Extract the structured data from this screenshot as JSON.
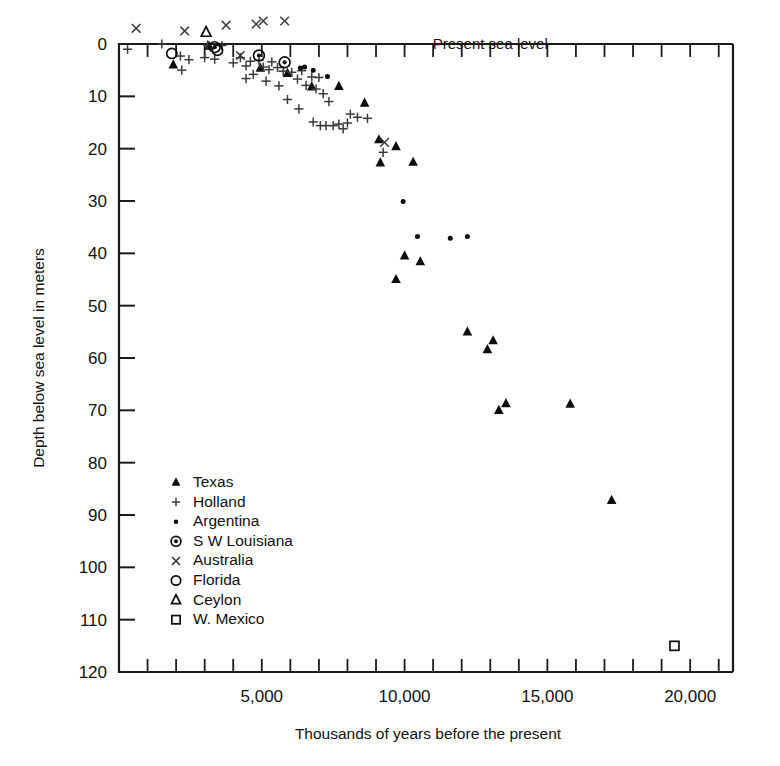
{
  "figure": {
    "background": "#ffffff",
    "ink": "#111111"
  },
  "axes": {
    "x_title": "Thousands of years before the present",
    "y_title": "Depth below sea level in meters",
    "x_tick_labels": [
      "5,000",
      "10,000",
      "15,000",
      "20,000"
    ],
    "x_tick_values": [
      5000,
      10000,
      15000,
      20000
    ],
    "y_tick_labels": [
      "0",
      "10",
      "20",
      "30",
      "40",
      "50",
      "60",
      "70",
      "80",
      "90",
      "100",
      "110",
      "120"
    ],
    "y_tick_values": [
      0,
      10,
      20,
      30,
      40,
      50,
      60,
      70,
      80,
      90,
      100,
      110,
      120
    ],
    "x_min": 0,
    "x_max": 21500,
    "y_min": 0,
    "y_max": 120,
    "x_minor_step": 1000,
    "y_major_step": 10
  },
  "annotations": [
    {
      "name": "present-sea-level",
      "text": "Present sea level",
      "x": 13000,
      "y": 0
    }
  ],
  "legend": {
    "entries": [
      {
        "label": "Texas",
        "marker": "filled-triangle"
      },
      {
        "label": "Holland",
        "marker": "plus"
      },
      {
        "label": "Argentina",
        "marker": "dot"
      },
      {
        "label": "S W Louisiana",
        "marker": "circled-dot"
      },
      {
        "label": "Australia",
        "marker": "cross"
      },
      {
        "label": "Florida",
        "marker": "open-circle"
      },
      {
        "label": "Ceylon",
        "marker": "open-triangle"
      },
      {
        "label": "W. Mexico",
        "marker": "open-square"
      }
    ]
  },
  "chart_data": {
    "type": "scatter",
    "title": "",
    "xlabel": "Thousands of years before the present",
    "ylabel": "Depth below sea level in meters",
    "xlim": [
      0,
      21500
    ],
    "ylim": [
      120,
      0
    ],
    "y_inverted": true,
    "grid": false,
    "legend_position": "inside-lower-left",
    "series": [
      {
        "name": "Texas",
        "marker": "filled-triangle",
        "points": [
          [
            1900,
            4.0
          ],
          [
            3150,
            0.4
          ],
          [
            4950,
            4.6
          ],
          [
            5900,
            5.6
          ],
          [
            6750,
            8.2
          ],
          [
            7700,
            8.1
          ],
          [
            8600,
            11.3
          ],
          [
            9100,
            18.3
          ],
          [
            9700,
            19.6
          ],
          [
            9150,
            22.7
          ],
          [
            10300,
            22.6
          ],
          [
            10000,
            40.5
          ],
          [
            9700,
            45.0
          ],
          [
            10550,
            41.6
          ],
          [
            12200,
            55.0
          ],
          [
            13100,
            56.7
          ],
          [
            12900,
            58.4
          ],
          [
            13300,
            70.0
          ],
          [
            13550,
            68.7
          ],
          [
            15800,
            68.8
          ],
          [
            17250,
            87.2
          ]
        ]
      },
      {
        "name": "Holland",
        "marker": "plus",
        "points": [
          [
            300,
            1.0
          ],
          [
            1500,
            0.0
          ],
          [
            2150,
            2.3
          ],
          [
            2450,
            3.0
          ],
          [
            2200,
            5.0
          ],
          [
            3000,
            2.6
          ],
          [
            3100,
            0.2
          ],
          [
            3350,
            2.9
          ],
          [
            3600,
            0.3
          ],
          [
            4000,
            3.6
          ],
          [
            4250,
            2.6
          ],
          [
            4450,
            4.2
          ],
          [
            4600,
            3.3
          ],
          [
            4700,
            5.8
          ],
          [
            4900,
            3.1
          ],
          [
            5050,
            4.4
          ],
          [
            5250,
            4.9
          ],
          [
            5350,
            3.4
          ],
          [
            5550,
            4.5
          ],
          [
            5750,
            5.2
          ],
          [
            5600,
            8.0
          ],
          [
            6050,
            5.4
          ],
          [
            6250,
            6.7
          ],
          [
            6400,
            5.1
          ],
          [
            6550,
            7.9
          ],
          [
            6750,
            6.3
          ],
          [
            6900,
            8.6
          ],
          [
            7000,
            6.4
          ],
          [
            6300,
            12.4
          ],
          [
            7150,
            9.5
          ],
          [
            7350,
            11.0
          ],
          [
            6800,
            14.9
          ],
          [
            7050,
            15.6
          ],
          [
            7250,
            15.6
          ],
          [
            7500,
            15.6
          ],
          [
            7700,
            15.3
          ],
          [
            7850,
            16.2
          ],
          [
            8000,
            15.1
          ],
          [
            8100,
            13.4
          ],
          [
            8350,
            14.0
          ],
          [
            8700,
            14.2
          ],
          [
            9250,
            20.7
          ],
          [
            5900,
            10.6
          ],
          [
            5150,
            7.1
          ],
          [
            4450,
            6.6
          ]
        ]
      },
      {
        "name": "Argentina",
        "marker": "dot",
        "points": [
          [
            6350,
            4.6
          ],
          [
            6500,
            4.4
          ],
          [
            6800,
            5.0
          ],
          [
            7300,
            6.2
          ],
          [
            9950,
            30.1
          ],
          [
            10450,
            36.8
          ],
          [
            11600,
            37.1
          ],
          [
            12200,
            36.8
          ]
        ]
      },
      {
        "name": "S W Louisiana",
        "marker": "circled-dot",
        "points": [
          [
            3350,
            0.6
          ],
          [
            4900,
            2.2
          ],
          [
            5800,
            3.5
          ]
        ]
      },
      {
        "name": "Australia",
        "marker": "cross",
        "points": [
          [
            600,
            -3.0
          ],
          [
            2300,
            -2.5
          ],
          [
            3750,
            -3.6
          ],
          [
            4800,
            -3.8
          ],
          [
            5050,
            -4.4
          ],
          [
            5800,
            -4.4
          ],
          [
            4250,
            2.2
          ],
          [
            9300,
            18.8
          ]
        ]
      },
      {
        "name": "Florida",
        "marker": "open-circle",
        "points": [
          [
            1850,
            1.8
          ],
          [
            3450,
            1.2
          ]
        ]
      },
      {
        "name": "Ceylon",
        "marker": "open-triangle",
        "points": [
          [
            3050,
            -2.2
          ]
        ]
      },
      {
        "name": "W. Mexico",
        "marker": "open-square",
        "points": [
          [
            19450,
            115.0
          ]
        ]
      }
    ]
  }
}
